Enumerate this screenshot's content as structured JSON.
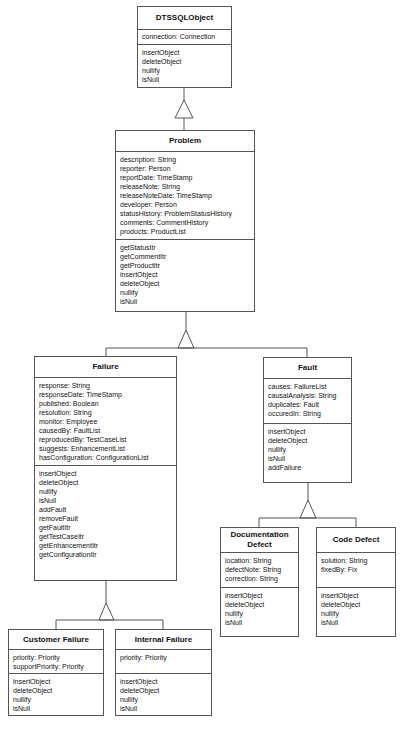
{
  "classes": {
    "dtssqlobject": {
      "name": "DTSSQLObject",
      "attributes": [
        "connection:  Connection"
      ],
      "methods": [
        "insertObject",
        "deleteObject",
        "nullify",
        "isNull"
      ]
    },
    "problem": {
      "name": "Problem",
      "attributes": [
        "description: String",
        "reporter:  Person",
        "reportDate:  TimeStamp",
        "releaseNote: String",
        "releaseNoteDate: TimeStamp",
        "developer:  Person",
        "statusHistory:  ProblemStatusHistory",
        "comments:  CommentHistory",
        "products:  ProductList"
      ],
      "methods": [
        "getStatusItr",
        "getCommentItr",
        "getProductItr",
        "insertObject",
        "deleteObject",
        "nullify",
        "isNull"
      ]
    },
    "failure": {
      "name": "Failure",
      "attributes": [
        "response:  String",
        "responseDate: TimeStamp",
        "published:  Boolean",
        "resolution:  String",
        "monitor:  Employee",
        "causedBy:  FaultList",
        "reproducedBy:  TestCaseList",
        "suggests:  EnhancementList",
        "hasConfiguration:  ConfigurationList"
      ],
      "methods": [
        "insertObject",
        "deleteObject",
        "nullify",
        "isNull",
        "addFault",
        "removeFault",
        "getFaultItr",
        "getTestCaseItr",
        "getEnhancementItr",
        "getConfigurationItr"
      ]
    },
    "fault": {
      "name": "Fault",
      "attributes": [
        "causes:  FailureList",
        "causalAnalysis:  String",
        "duplicates:  Fault",
        "occuredIn:  String"
      ],
      "methods": [
        "insertObject",
        "deleteObject",
        "nullify",
        "isNull",
        "addFailure"
      ]
    },
    "documentation_defect": {
      "name": "Documentation Defect",
      "attributes": [
        "location: String",
        "defectNote: String",
        "correction: String"
      ],
      "methods": [
        "insertObject",
        "deleteObject",
        "nullify",
        "isNull"
      ]
    },
    "code_defect": {
      "name": "Code Defect",
      "attributes": [
        "solution: String",
        "fixedBy:  Fix"
      ],
      "methods": [
        "insertObject",
        "deleteObject",
        "nullify",
        "isNull"
      ]
    },
    "customer_failure": {
      "name": "Customer Failure",
      "attributes": [
        "priority: Priority",
        "supportPriority:  Priority"
      ],
      "methods": [
        "insertObject",
        "deleteObject",
        "nullify",
        "isNull"
      ]
    },
    "internal_failure": {
      "name": "Internal Failure",
      "attributes": [
        "priority: Priority"
      ],
      "methods": [
        "insertObject",
        "deleteObject",
        "nullify",
        "isNull"
      ]
    }
  },
  "relationships": [
    {
      "type": "generalization",
      "child": "Problem",
      "parent": "DTSSQLObject"
    },
    {
      "type": "generalization",
      "child": "Failure",
      "parent": "Problem"
    },
    {
      "type": "generalization",
      "child": "Fault",
      "parent": "Problem"
    },
    {
      "type": "generalization",
      "child": "Documentation Defect",
      "parent": "Fault"
    },
    {
      "type": "generalization",
      "child": "Code Defect",
      "parent": "Fault"
    },
    {
      "type": "generalization",
      "child": "Customer Failure",
      "parent": "Failure"
    },
    {
      "type": "generalization",
      "child": "Internal Failure",
      "parent": "Failure"
    }
  ]
}
